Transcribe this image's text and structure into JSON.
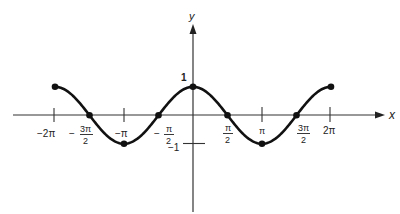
{
  "chart_data": {
    "type": "line",
    "title": "",
    "function": "y = cos x",
    "xlabel": "x",
    "ylabel": "y",
    "xlim": [
      -6.2832,
      6.2832
    ],
    "ylim": [
      -1,
      1
    ],
    "grid": false,
    "legend": null,
    "x_ticks": [
      {
        "value": -6.2832,
        "label": "−2π"
      },
      {
        "value": -4.7124,
        "label_num": "3π",
        "label_den": "2",
        "sign": "−"
      },
      {
        "value": -3.1416,
        "label": "−π"
      },
      {
        "value": -1.5708,
        "label_num": "π",
        "label_den": "2",
        "sign": "−"
      },
      {
        "value": 1.5708,
        "label_num": "π",
        "label_den": "2",
        "sign": ""
      },
      {
        "value": 3.1416,
        "label": "π"
      },
      {
        "value": 4.7124,
        "label_num": "3π",
        "label_den": "2",
        "sign": ""
      },
      {
        "value": 6.2832,
        "label": "2π"
      }
    ],
    "y_ticks": [
      {
        "value": 1,
        "label": "1"
      },
      {
        "value": -1,
        "label": "−1"
      }
    ],
    "marked_points": [
      {
        "x": "-2π",
        "y": 1
      },
      {
        "x": "-3π/2",
        "y": 0
      },
      {
        "x": "-π",
        "y": -1
      },
      {
        "x": "-π/2",
        "y": 0
      },
      {
        "x": "0",
        "y": 1
      },
      {
        "x": "π/2",
        "y": 0
      },
      {
        "x": "π",
        "y": -1
      },
      {
        "x": "3π/2",
        "y": 0
      },
      {
        "x": "2π",
        "y": 1
      }
    ],
    "x": [
      -6.2832,
      -4.7124,
      -3.1416,
      -1.5708,
      0,
      1.5708,
      3.1416,
      4.7124,
      6.2832
    ],
    "series": [
      {
        "name": "cos x",
        "values": [
          1,
          0,
          -1,
          0,
          1,
          0,
          -1,
          0,
          1
        ]
      }
    ]
  },
  "labels": {
    "x_axis": "x",
    "y_axis": "y",
    "y_one": "1",
    "y_neg_one": "−1",
    "neg_two_pi": "−2π",
    "neg_pi": "−π",
    "pi": "π",
    "two_pi": "2π",
    "minus": "−",
    "three_pi": "3π",
    "pi_sym": "π",
    "two": "2"
  }
}
